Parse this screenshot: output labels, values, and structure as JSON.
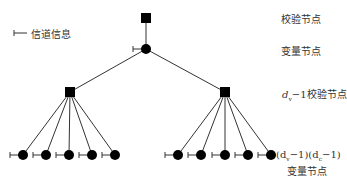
{
  "legend": {
    "label": "信道信息",
    "icon": "channel-info-tick-icon"
  },
  "labels": {
    "check_node": "校验节点",
    "variable_node": "变量节点",
    "dv_check": "d",
    "dv_check_sub": "v",
    "dv_check_rest": "−1校验节点",
    "bottom_line1": "(d",
    "bottom_sub1": "v",
    "bottom_mid": "−1)(d",
    "bottom_sub2": "c",
    "bottom_end": "−1)",
    "bottom_line2": "变量节点"
  },
  "tree": {
    "root_check": {
      "x": 146,
      "y": 18
    },
    "root_var": {
      "x": 146,
      "y": 49
    },
    "check_nodes": [
      {
        "x": 70,
        "y": 92
      },
      {
        "x": 225,
        "y": 92
      }
    ],
    "variable_leaves": [
      {
        "parent": 0,
        "x": [
          23,
          46,
          69,
          92,
          115
        ],
        "y": 155
      },
      {
        "parent": 1,
        "x": [
          178,
          201,
          225,
          248,
          271
        ],
        "y": 155
      }
    ]
  }
}
